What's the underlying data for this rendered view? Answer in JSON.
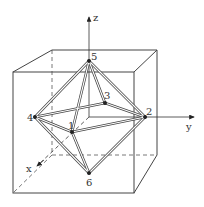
{
  "diagram": {
    "axes": {
      "x": "x",
      "y": "y",
      "z": "z"
    },
    "vertices": [
      {
        "id": "1",
        "label": "1"
      },
      {
        "id": "2",
        "label": "2"
      },
      {
        "id": "3",
        "label": "3"
      },
      {
        "id": "4",
        "label": "4"
      },
      {
        "id": "5",
        "label": "5"
      },
      {
        "id": "6",
        "label": "6"
      }
    ],
    "colors": {
      "line": "#444444",
      "background": "#ffffff"
    }
  }
}
